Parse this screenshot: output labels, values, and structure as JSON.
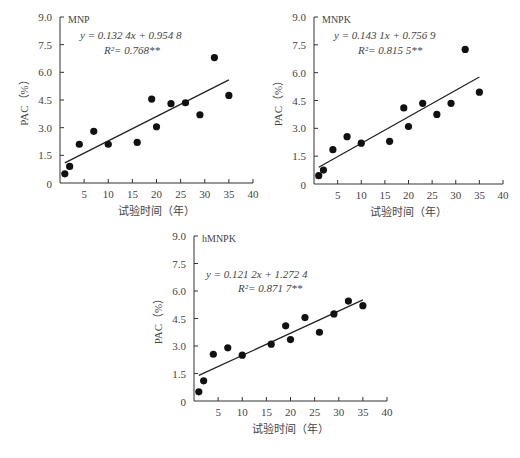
{
  "chart_data": [
    {
      "type": "scatter",
      "panel": "MNP",
      "title": "MNP",
      "equation": "y = 0.132 4x + 0.954 8",
      "r2": "R²= 0.768**",
      "xlabel": "试验时间（年）",
      "ylabel": "PAC（%）",
      "xlim": [
        0,
        40
      ],
      "ylim": [
        0,
        9.0
      ],
      "xticks": [
        5,
        10,
        15,
        20,
        25,
        30,
        35,
        40
      ],
      "yticks": [
        "0",
        "1.5",
        "3.0",
        "4.5",
        "6.0",
        "7.5",
        "9.0"
      ],
      "x": [
        1,
        2,
        4,
        7,
        10,
        16,
        19,
        20,
        23,
        26,
        29,
        32,
        35
      ],
      "y": [
        0.5,
        0.9,
        2.1,
        2.8,
        2.1,
        2.2,
        4.55,
        3.05,
        4.3,
        4.35,
        3.7,
        6.8,
        4.75
      ],
      "fit": {
        "slope": 0.1324,
        "intercept": 0.9548,
        "x_range": [
          1,
          35
        ]
      }
    },
    {
      "type": "scatter",
      "panel": "MNPK",
      "title": "MNPK",
      "equation": "y = 0.143 1x + 0.756 9",
      "r2": "R²= 0.815 5**",
      "xlabel": "试验时间（年）",
      "ylabel": "PAC（%）",
      "xlim": [
        0,
        40
      ],
      "ylim": [
        0,
        9.0
      ],
      "xticks": [
        5,
        10,
        15,
        20,
        25,
        30,
        35,
        40
      ],
      "yticks": [
        "0",
        "1.5",
        "3.0",
        "4.5",
        "6.0",
        "7.5",
        "9.0"
      ],
      "x": [
        1,
        2,
        4,
        7,
        10,
        16,
        19,
        20,
        23,
        26,
        29,
        32,
        35
      ],
      "y": [
        0.45,
        0.75,
        1.85,
        2.55,
        2.2,
        2.3,
        4.1,
        3.1,
        4.35,
        3.75,
        4.35,
        7.25,
        4.95
      ],
      "fit": {
        "slope": 0.1431,
        "intercept": 0.7569,
        "x_range": [
          1,
          35
        ]
      }
    },
    {
      "type": "scatter",
      "panel": "hMNPK",
      "title": "hMNPK",
      "equation": "y = 0.121 2x + 1.272 4",
      "r2": "R²= 0.871 7**",
      "xlabel": "试验时间（年）",
      "ylabel": "PAC（%）",
      "xlim": [
        0,
        40
      ],
      "ylim": [
        0,
        9.0
      ],
      "xticks": [
        5,
        10,
        15,
        20,
        25,
        30,
        35,
        40
      ],
      "yticks": [
        "0",
        "1.5",
        "3.0",
        "4.5",
        "6.0",
        "7.5",
        "9.0"
      ],
      "x": [
        1,
        2,
        4,
        7,
        10,
        16,
        19,
        20,
        23,
        26,
        29,
        32,
        35
      ],
      "y": [
        0.5,
        1.1,
        2.55,
        2.9,
        2.5,
        3.1,
        4.1,
        3.35,
        4.55,
        3.75,
        4.75,
        5.45,
        5.2
      ],
      "fit": {
        "slope": 0.1212,
        "intercept": 1.2724,
        "x_range": [
          1,
          35
        ]
      }
    }
  ],
  "layout": [
    {
      "left": 0,
      "top": 0,
      "x0": 60,
      "x1": 253,
      "yTop": 17,
      "yBot": 183
    },
    {
      "left": 0,
      "top": 0,
      "x0": 314,
      "x1": 503,
      "yTop": 17,
      "yBot": 184
    },
    {
      "left": 0,
      "top": 0,
      "x0": 194,
      "x1": 387,
      "yTop": 236,
      "yBot": 401
    }
  ]
}
